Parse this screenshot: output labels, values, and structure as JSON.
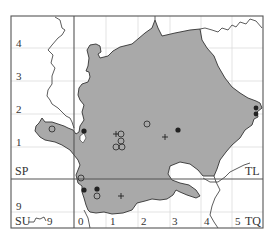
{
  "map": {
    "grid_squares": {
      "top_left": "SP",
      "top_right": "TL",
      "bottom_left": "SU",
      "bottom_right": "TQ"
    },
    "y_labels": [
      {
        "text": "4",
        "y": 43
      },
      {
        "text": "3",
        "y": 76
      },
      {
        "text": "2",
        "y": 109
      },
      {
        "text": "1",
        "y": 141
      },
      {
        "text": "9",
        "y": 206
      }
    ],
    "x_labels": [
      {
        "text": "9",
        "x": 47
      },
      {
        "text": "0",
        "x": 78
      },
      {
        "text": "1",
        "x": 110
      },
      {
        "text": "2",
        "x": 142
      },
      {
        "text": "3",
        "x": 173
      },
      {
        "text": "4",
        "x": 205
      },
      {
        "text": "5",
        "x": 236
      }
    ],
    "colors": {
      "fill": "#a9a9a9",
      "outline": "#333333",
      "grid": "#dcdcdc",
      "frame": "#555555"
    },
    "markers": {
      "open_circle": [
        [
          52,
          129
        ],
        [
          85,
          103
        ],
        [
          118,
          134
        ],
        [
          118,
          143
        ],
        [
          114,
          150
        ],
        [
          118,
          150
        ],
        [
          123,
          150
        ],
        [
          147,
          124
        ],
        [
          81,
          177
        ],
        [
          97,
          196
        ]
      ],
      "filled_circle": [
        [
          84,
          131
        ],
        [
          179,
          130
        ],
        [
          84,
          190
        ],
        [
          97,
          190
        ],
        [
          257,
          106
        ],
        [
          257,
          113
        ]
      ],
      "plus": [
        [
          116,
          136
        ],
        [
          165,
          137
        ],
        [
          121,
          196
        ]
      ]
    }
  }
}
